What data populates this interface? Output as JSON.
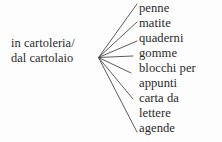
{
  "diagram": {
    "type": "word-web",
    "language": "Italian",
    "source": {
      "lines": [
        "in cartoleria/",
        "dal cartolaio"
      ]
    },
    "items": [
      {
        "label": "penne",
        "display_lines": [
          "penne"
        ]
      },
      {
        "label": "matite",
        "display_lines": [
          "matite"
        ]
      },
      {
        "label": "quaderni",
        "display_lines": [
          "quaderni"
        ]
      },
      {
        "label": "gomme",
        "display_lines": [
          "gomme"
        ]
      },
      {
        "label": "blocchi per appunti",
        "display_lines": [
          "blocchi per",
          "appunti"
        ]
      },
      {
        "label": "carta da lettere",
        "display_lines": [
          "carta da",
          "lettere"
        ]
      },
      {
        "label": "agende",
        "display_lines": [
          "agende"
        ]
      }
    ],
    "text_rows": [
      "penne",
      "matite",
      "quaderni",
      "gomme",
      "blocchi per",
      "appunti",
      "carta da",
      "lettere",
      "agende"
    ],
    "colors": {
      "background": "#fdfdfd",
      "text": "#2b2b2b",
      "line": "#4a4a4a"
    },
    "connectors": [
      {
        "to": "penne",
        "x1": 98.5,
        "y1": 57.5,
        "x2": 137,
        "y2": 4
      },
      {
        "to": "matite",
        "x1": 98.5,
        "y1": 57.5,
        "x2": 137,
        "y2": 22
      },
      {
        "to": "quaderni",
        "x1": 98.5,
        "y1": 57.5,
        "x2": 137,
        "y2": 41
      },
      {
        "to": "gomme",
        "x1": 98.5,
        "y1": 57.5,
        "x2": 133,
        "y2": 56
      },
      {
        "to": "blocchi per appunti",
        "x1": 98.5,
        "y1": 57.5,
        "x2": 131,
        "y2": 73
      },
      {
        "to": "carta da lettere",
        "x1": 98.5,
        "y1": 57.5,
        "x2": 133,
        "y2": 99
      },
      {
        "to": "agende",
        "x1": 98.5,
        "y1": 57.5,
        "x2": 137,
        "y2": 132
      }
    ]
  }
}
